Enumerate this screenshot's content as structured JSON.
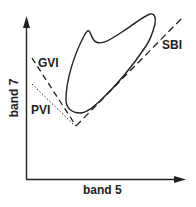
{
  "diagram": {
    "axes": {
      "x_label": "band 5",
      "y_label": "band 7"
    },
    "lines": [
      {
        "id": "gvi",
        "label": "GVI",
        "style": "dashed"
      },
      {
        "id": "pvi",
        "label": "PVI",
        "style": "dotted"
      },
      {
        "id": "sbi",
        "label": "SBI",
        "style": "dashed"
      }
    ],
    "shape": {
      "description": "closed data cloud outline (tasseled-cap region)"
    },
    "colors": {
      "ink": "#222222",
      "background": "#ffffff"
    }
  }
}
